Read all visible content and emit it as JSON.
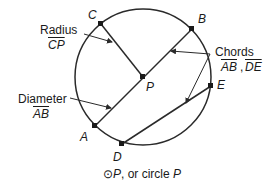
{
  "diagram": {
    "points": {
      "A": "A",
      "B": "B",
      "C": "C",
      "D": "D",
      "E": "E",
      "P": "P"
    },
    "labels": {
      "radius": {
        "title": "Radius",
        "segment": "CP"
      },
      "diameter": {
        "title": "Diameter",
        "segment": "AB"
      },
      "chords": {
        "title": "Chords",
        "segment1": "AB",
        "separator": ",",
        "segment2": "DE"
      }
    },
    "caption": {
      "symbol": "⊙",
      "point": "P",
      "text": ", or circle ",
      "point2": "P"
    },
    "colors": {
      "stroke": "#2a2a2a",
      "text": "#1a1a1a",
      "background": "#ffffff"
    }
  }
}
